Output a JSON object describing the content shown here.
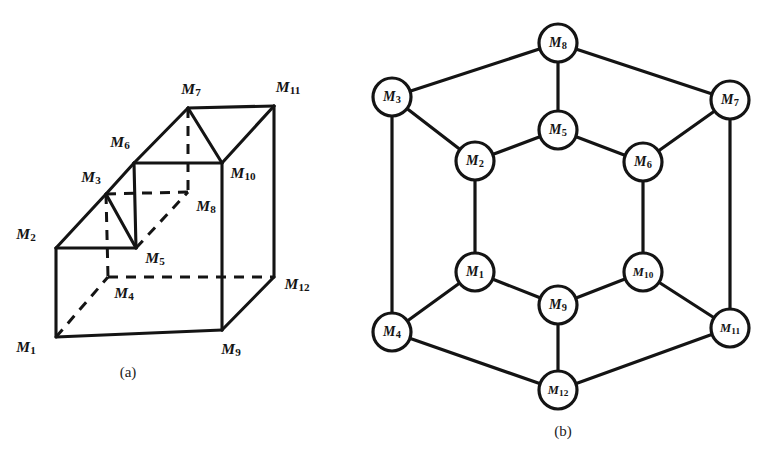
{
  "figure": {
    "background_color": "#ffffff",
    "ink_color": "#141414",
    "panels": [
      {
        "id": "a",
        "caption": "(a)",
        "caption_x": 128,
        "caption_y": 372,
        "type": "3d-solid-diagram"
      },
      {
        "id": "b",
        "caption": "(b)",
        "caption_x": 563,
        "caption_y": 431,
        "type": "planar-graph-diagram"
      }
    ]
  },
  "panel_a": {
    "caption": "(a)",
    "description": "stepped-block solid with twelve labelled corners",
    "vertices": [
      {
        "id": "M1",
        "label": "M",
        "sub": "1",
        "x": 56,
        "y": 337,
        "label_x": 26,
        "label_y": 348
      },
      {
        "id": "M2",
        "label": "M",
        "sub": "2",
        "x": 56,
        "y": 248,
        "label_x": 26,
        "label_y": 235
      },
      {
        "id": "M3",
        "label": "M",
        "sub": "3",
        "x": 106,
        "y": 194,
        "label_x": 91,
        "label_y": 178
      },
      {
        "id": "M4",
        "label": "M",
        "sub": "4",
        "x": 108,
        "y": 277,
        "label_x": 124,
        "label_y": 294
      },
      {
        "id": "M5",
        "label": "M",
        "sub": "5",
        "x": 136,
        "y": 248,
        "label_x": 155,
        "label_y": 259
      },
      {
        "id": "M6",
        "label": "M",
        "sub": "6",
        "x": 134,
        "y": 163,
        "label_x": 120,
        "label_y": 143
      },
      {
        "id": "M7",
        "label": "M",
        "sub": "7",
        "x": 188,
        "y": 108,
        "label_x": 191,
        "label_y": 90
      },
      {
        "id": "M8",
        "label": "M",
        "sub": "8",
        "x": 188,
        "y": 192,
        "label_x": 206,
        "label_y": 207
      },
      {
        "id": "M9",
        "label": "M",
        "sub": "9",
        "x": 222,
        "y": 330,
        "label_x": 231,
        "label_y": 350
      },
      {
        "id": "M10",
        "label": "M",
        "sub": "10",
        "x": 222,
        "y": 163,
        "label_x": 243,
        "label_y": 174
      },
      {
        "id": "M11",
        "label": "M",
        "sub": "11",
        "x": 274,
        "y": 106,
        "label_x": 288,
        "label_y": 88
      },
      {
        "id": "M12",
        "label": "M",
        "sub": "12",
        "x": 274,
        "y": 277,
        "label_x": 297,
        "label_y": 285
      }
    ],
    "solid_edges": [
      [
        "M1",
        "M2"
      ],
      [
        "M1",
        "M9"
      ],
      [
        "M2",
        "M3"
      ],
      [
        "M2",
        "M5"
      ],
      [
        "M3",
        "M5"
      ],
      [
        "M3",
        "M6"
      ],
      [
        "M5",
        "M6"
      ],
      [
        "M6",
        "M7"
      ],
      [
        "M6",
        "M10"
      ],
      [
        "M7",
        "M11"
      ],
      [
        "M7",
        "M10"
      ],
      [
        "M10",
        "M11"
      ],
      [
        "M10",
        "M9"
      ],
      [
        "M9",
        "M12"
      ],
      [
        "M11",
        "M12"
      ]
    ],
    "hidden_edges": [
      [
        "M1",
        "M4"
      ],
      [
        "M3",
        "M4"
      ],
      [
        "M4",
        "M12"
      ],
      [
        "M3",
        "M8"
      ],
      [
        "M5",
        "M8"
      ],
      [
        "M7",
        "M8"
      ]
    ]
  },
  "panel_b": {
    "caption": "(b)",
    "description": "planar graph representation with twelve circled nodes",
    "node_radius": 19,
    "nodes": [
      {
        "id": "M1",
        "label": "M",
        "sub": "1",
        "x": 475,
        "y": 272
      },
      {
        "id": "M2",
        "label": "M",
        "sub": "2",
        "x": 475,
        "y": 161
      },
      {
        "id": "M3",
        "label": "M",
        "sub": "3",
        "x": 392,
        "y": 97
      },
      {
        "id": "M4",
        "label": "M",
        "sub": "4",
        "x": 392,
        "y": 332
      },
      {
        "id": "M5",
        "label": "M",
        "sub": "5",
        "x": 558,
        "y": 130
      },
      {
        "id": "M6",
        "label": "M",
        "sub": "6",
        "x": 643,
        "y": 162
      },
      {
        "id": "M7",
        "label": "M",
        "sub": "7",
        "x": 730,
        "y": 100
      },
      {
        "id": "M8",
        "label": "M",
        "sub": "8",
        "x": 558,
        "y": 43
      },
      {
        "id": "M9",
        "label": "M",
        "sub": "9",
        "x": 558,
        "y": 305
      },
      {
        "id": "M10",
        "label": "M",
        "sub": "10",
        "x": 643,
        "y": 272
      },
      {
        "id": "M11",
        "label": "M",
        "sub": "11",
        "x": 730,
        "y": 328
      },
      {
        "id": "M12",
        "label": "M",
        "sub": "12",
        "x": 558,
        "y": 390
      }
    ],
    "edges": [
      [
        "M3",
        "M8"
      ],
      [
        "M8",
        "M7"
      ],
      [
        "M3",
        "M2"
      ],
      [
        "M2",
        "M5"
      ],
      [
        "M5",
        "M6"
      ],
      [
        "M6",
        "M7"
      ],
      [
        "M8",
        "M5"
      ],
      [
        "M3",
        "M4"
      ],
      [
        "M7",
        "M11"
      ],
      [
        "M2",
        "M1"
      ],
      [
        "M6",
        "M10"
      ],
      [
        "M1",
        "M9"
      ],
      [
        "M9",
        "M10"
      ],
      [
        "M4",
        "M1"
      ],
      [
        "M10",
        "M11"
      ],
      [
        "M4",
        "M12"
      ],
      [
        "M12",
        "M11"
      ],
      [
        "M9",
        "M12"
      ]
    ]
  },
  "bleed": {
    "text": "scanned page bleed-through"
  }
}
